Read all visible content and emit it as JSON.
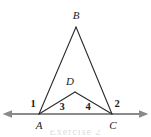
{
  "figure": {
    "stroke_color": "#2b2b2b",
    "baseline_color": "#8a8a8a",
    "background_color": "#ffffff",
    "canvas": {
      "width": 151,
      "height": 137
    }
  },
  "baseline": {
    "name": "line AC extended",
    "y": 114,
    "x_start": 3,
    "x_end": 148,
    "left_arrow": true,
    "right_arrow": true
  },
  "points": {
    "A": {
      "label": "A",
      "x": 39,
      "y": 114,
      "label_x": 39,
      "label_y": 125
    },
    "B": {
      "label": "B",
      "x": 76,
      "y": 27,
      "label_x": 76,
      "label_y": 15
    },
    "C": {
      "label": "C",
      "x": 112,
      "y": 114,
      "label_x": 113,
      "label_y": 125
    },
    "D": {
      "label": "D",
      "x": 75,
      "y": 92,
      "label_x": 70,
      "label_y": 81
    }
  },
  "segments": [
    {
      "name": "AB",
      "from": "A",
      "to": "B"
    },
    {
      "name": "BC",
      "from": "B",
      "to": "C"
    },
    {
      "name": "AD",
      "from": "A",
      "to": "D"
    },
    {
      "name": "DC",
      "from": "D",
      "to": "C"
    }
  ],
  "angle_labels": [
    {
      "name": "angle-1",
      "text": "1",
      "x": 33,
      "y": 104
    },
    {
      "name": "angle-3",
      "text": "3",
      "x": 62,
      "y": 107
    },
    {
      "name": "angle-4",
      "text": "4",
      "x": 88,
      "y": 107
    },
    {
      "name": "angle-2",
      "text": "2",
      "x": 117,
      "y": 104
    }
  ],
  "caption": {
    "text": "Exercise 2"
  }
}
